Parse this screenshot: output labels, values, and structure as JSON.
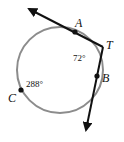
{
  "figure": {
    "type": "tangent lines to circle",
    "points": {
      "A": "A",
      "T": "T",
      "B": "B",
      "C": "C"
    },
    "arcs": {
      "minor_arc_AB": "72°",
      "major_arc_ACB": "288°"
    },
    "colors": {
      "circle": "#8c8c8c",
      "lines": "#111111",
      "background": "#ffffff"
    }
  }
}
